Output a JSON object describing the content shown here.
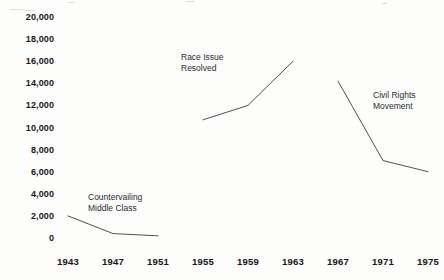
{
  "chart_data": {
    "type": "line",
    "title": "",
    "subtitle": "",
    "xlabel": "",
    "ylabel": "",
    "xlim": [
      1941,
      1977
    ],
    "ylim": [
      0,
      20000
    ],
    "grid": false,
    "legend": "none",
    "line_color": "#3d3d42",
    "x_ticks": [
      1943,
      1947,
      1951,
      1955,
      1959,
      1963,
      1967,
      1971,
      1975
    ],
    "x_tick_labels": [
      "1943",
      "1947",
      "1951",
      "1955",
      "1959",
      "1963",
      "1967",
      "1971",
      "1975"
    ],
    "y_ticks": [
      0,
      2000,
      4000,
      6000,
      8000,
      10000,
      12000,
      14000,
      16000,
      18000,
      20000
    ],
    "y_tick_labels": [
      "0",
      "2,000",
      "4,000",
      "6,000",
      "8,000",
      "10,000",
      "12,000",
      "14,000",
      "16,000",
      "18,000",
      "20,000"
    ],
    "series": [
      {
        "name": "Countervailing Middle Class",
        "x": [
          1943,
          1947,
          1951
        ],
        "values": [
          2000,
          400,
          200
        ]
      },
      {
        "name": "Race Issue Resolved",
        "x": [
          1955,
          1959,
          1963
        ],
        "values": [
          10700,
          12000,
          16000
        ]
      },
      {
        "name": "Civil Rights Movement",
        "x": [
          1967,
          1971,
          1975
        ],
        "values": [
          14200,
          7000,
          6000
        ]
      }
    ],
    "annotations": [
      {
        "id": "countervailing-middle-class",
        "line1": "Countervailing",
        "line2": "Middle Class",
        "x": 88,
        "y": 192
      },
      {
        "id": "race-issue-resolved",
        "line1": "Race Issue",
        "line2": "Resolved",
        "x": 181,
        "y": 52
      },
      {
        "id": "civil-rights-movement",
        "line1": "Civil Rights",
        "line2": "Movement",
        "x": 373,
        "y": 90
      }
    ]
  }
}
